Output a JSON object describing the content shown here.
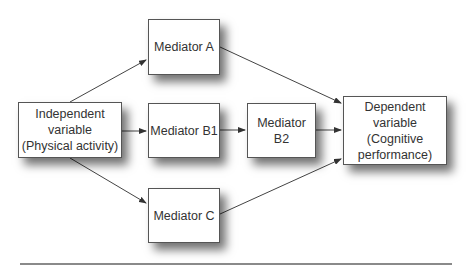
{
  "diagram": {
    "nodes": {
      "independent": {
        "lines": [
          "Independent",
          "variable",
          "(Physical activity)"
        ]
      },
      "mediator_a": {
        "label": "Mediator A"
      },
      "mediator_b1": {
        "label": "Mediator B1"
      },
      "mediator_b2": {
        "label": "Mediator B2"
      },
      "mediator_c": {
        "label": "Mediator C"
      },
      "dependent": {
        "lines": [
          "Dependent",
          "variable",
          "(Cognitive",
          "performance)"
        ]
      }
    },
    "edges": [
      {
        "from": "independent",
        "to": "mediator_a"
      },
      {
        "from": "independent",
        "to": "mediator_b1"
      },
      {
        "from": "independent",
        "to": "mediator_c"
      },
      {
        "from": "mediator_a",
        "to": "dependent"
      },
      {
        "from": "mediator_b1",
        "to": "mediator_b2"
      },
      {
        "from": "mediator_b2",
        "to": "dependent"
      },
      {
        "from": "mediator_c",
        "to": "dependent"
      }
    ]
  }
}
